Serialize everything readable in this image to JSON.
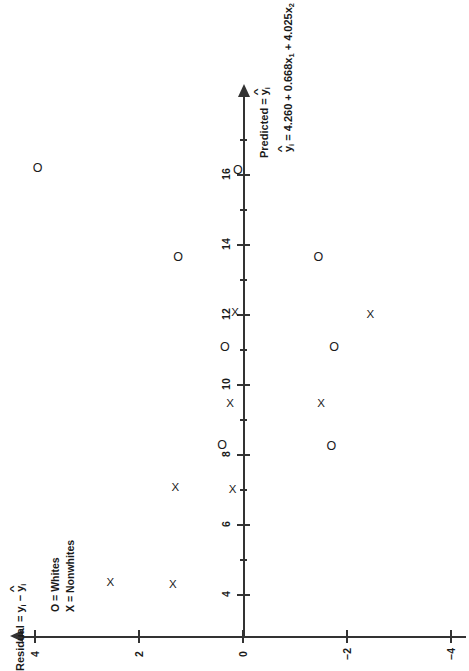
{
  "figure": {
    "type": "scatter",
    "axis_x_label_plain": "Predicted = ŷi",
    "axis_y_label_plain": "Residual = yi − ŷi",
    "equation_plain": "ŷi = 4.260 + 0.668x1 + 4.025x2",
    "equation_parts": {
      "lhs": "y",
      "lhs_sub": "i",
      "eq": " = 4.260 + 0.668x",
      "t1_sub": "1",
      "plus": " + 4.025x",
      "t2_sub": "2"
    },
    "pred_label_parts": {
      "prefix": "Predicted = ",
      "y": "y",
      "sub": "i"
    },
    "resid_label_parts": {
      "prefix": "Residual = ",
      "y1": "y",
      "sub1": "i",
      "minus": " − ",
      "y2": "y",
      "sub2": "i"
    }
  },
  "legend": {
    "position": "upper-left",
    "entries": [
      {
        "marker": "O",
        "sep": " = ",
        "label": "Whites"
      },
      {
        "marker": "X",
        "sep": " = ",
        "label": "Nonwhites"
      }
    ]
  },
  "chart_data": {
    "type": "scatter",
    "title": "",
    "xlabel": "Predicted = ŷi",
    "ylabel": "Residual = yi − ŷi",
    "annotation": "ŷi = 4.260 + 0.668x1 + 4.025x2",
    "xlim": [
      3.0,
      17.5
    ],
    "ylim": [
      -5.0,
      5.0
    ],
    "xticks": [
      4,
      6,
      8,
      10,
      12,
      14,
      16
    ],
    "xticks_minor": [
      5,
      7,
      9,
      11,
      13,
      15,
      17
    ],
    "yticks": [
      4,
      2,
      0,
      -2,
      -4
    ],
    "yticks_minor": [
      3,
      1,
      -1,
      -3
    ],
    "grid": false,
    "legend_position": "upper left",
    "series": [
      {
        "name": "Whites",
        "marker": "O",
        "points": [
          {
            "x": 16.2,
            "y": 3.95
          },
          {
            "x": 16.15,
            "y": 0.1
          },
          {
            "x": 13.65,
            "y": 1.25
          },
          {
            "x": 13.65,
            "y": -1.45
          },
          {
            "x": 11.1,
            "y": 0.35
          },
          {
            "x": 11.1,
            "y": -1.75
          },
          {
            "x": 8.3,
            "y": 0.4
          },
          {
            "x": 8.25,
            "y": -1.7
          }
        ]
      },
      {
        "name": "Nonwhites",
        "marker": "X",
        "points": [
          {
            "x": 12.05,
            "y": 0.15
          },
          {
            "x": 12.0,
            "y": -2.45
          },
          {
            "x": 9.45,
            "y": 0.25
          },
          {
            "x": 9.45,
            "y": -1.5
          },
          {
            "x": 7.05,
            "y": 1.3
          },
          {
            "x": 7.0,
            "y": 0.2
          },
          {
            "x": 4.35,
            "y": 2.55
          },
          {
            "x": 4.3,
            "y": 1.35
          }
        ]
      }
    ]
  }
}
